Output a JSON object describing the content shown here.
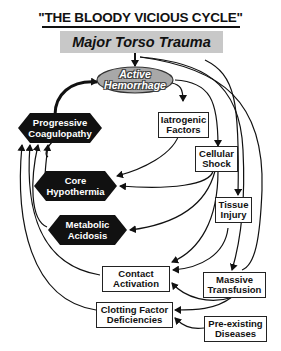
{
  "title": "\"THE BLOODY VICIOUS CYCLE\"",
  "banner": "Major Torso Trauma",
  "nodes": {
    "active_hemorrhage": {
      "line1": "Active",
      "line2": "Hemorrhage"
    },
    "progressive_coagulopathy": {
      "line1": "Progressive",
      "line2": "Coagulopathy"
    },
    "core_hypothermia": {
      "line1": "Core",
      "line2": "Hypothermia"
    },
    "metabolic_acidosis": {
      "line1": "Metabolic",
      "line2": "Acidosis"
    },
    "iatrogenic_factors": {
      "line1": "Iatrogenic",
      "line2": "Factors"
    },
    "cellular_shock": {
      "line1": "Cellular",
      "line2": "Shock"
    },
    "tissue_injury": {
      "line1": "Tissue",
      "line2": "Injury"
    },
    "contact_activation": {
      "line1": "Contact",
      "line2": "Activation"
    },
    "massive_transfusion": {
      "line1": "Massive",
      "line2": "Transfusion"
    },
    "clotting_factor_deficiencies": {
      "line1": "Clotting Factor",
      "line2": "Deficiencies"
    },
    "pre_existing_diseases": {
      "line1": "Pre-existing",
      "line2": "Diseases"
    }
  },
  "colors": {
    "banner": "#c8c8c8",
    "ellipse": "#a8a8a8",
    "hexagon": "#111111",
    "line": "#111111"
  }
}
